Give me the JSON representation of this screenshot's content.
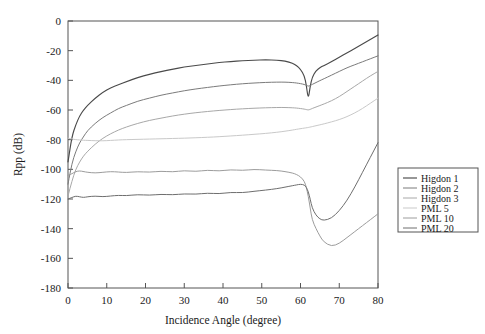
{
  "chart_data": {
    "type": "line",
    "title": "",
    "xlabel": "Incidence Angle (degree)",
    "ylabel": "Rpp (dB)",
    "xlim": [
      0,
      80
    ],
    "ylim": [
      -180,
      0
    ],
    "xticks": [
      0,
      10,
      20,
      30,
      40,
      50,
      60,
      70,
      80
    ],
    "yticks": [
      0,
      -20,
      -40,
      -60,
      -80,
      -100,
      -120,
      -140,
      -160,
      -180
    ],
    "xtick_labels": [
      "0",
      "10",
      "20",
      "30",
      "40",
      "50",
      "60",
      "70",
      "80"
    ],
    "ytick_labels": [
      "0",
      "-20",
      "-40",
      "-60",
      "-80",
      "-100",
      "-120",
      "-140",
      "-160",
      "-180"
    ],
    "grid": false,
    "legend_position": "right-outside",
    "brewster_angle": 62,
    "x": [
      0,
      1,
      2,
      3,
      4,
      5,
      7,
      9,
      11,
      13,
      15,
      18,
      21,
      24,
      27,
      30,
      33,
      36,
      39,
      42,
      45,
      48,
      51,
      54,
      56,
      58,
      59,
      60,
      61,
      61.5,
      62,
      62.5,
      63,
      64,
      65,
      66,
      68,
      70,
      72,
      74,
      76,
      78,
      80
    ],
    "series": [
      {
        "name": "Higdon 1",
        "color": "#4a4a4a",
        "width": 1.15,
        "values": [
          -95,
          -78,
          -70,
          -64,
          -60,
          -57,
          -52,
          -48,
          -45,
          -43,
          -41,
          -38,
          -36,
          -34,
          -32.5,
          -31,
          -30,
          -29,
          -28,
          -27.3,
          -26.8,
          -26.4,
          -26.2,
          -26.4,
          -27,
          -28.5,
          -30,
          -32.5,
          -37,
          -43,
          -53,
          -44,
          -38,
          -33.5,
          -31.5,
          -30,
          -27.5,
          -24.5,
          -21.5,
          -18.5,
          -15.5,
          -12.5,
          -9.5
        ]
      },
      {
        "name": "Higdon 2",
        "color": "#7b7b7b",
        "width": 1.0,
        "values": [
          -110,
          -96,
          -88,
          -82,
          -78,
          -74,
          -69,
          -65,
          -62,
          -59,
          -57,
          -54,
          -52,
          -50,
          -48.5,
          -47,
          -45.8,
          -44.8,
          -43.8,
          -43,
          -42.3,
          -41.8,
          -41.4,
          -41.2,
          -41.2,
          -41.5,
          -41.8,
          -42.2,
          -42.8,
          -43.3,
          -44,
          -43.5,
          -42.8,
          -41.5,
          -40.2,
          -39,
          -36.5,
          -34,
          -31.5,
          -29.5,
          -27.5,
          -25.5,
          -23.5
        ]
      },
      {
        "name": "Higdon 3",
        "color": "#a8a8a8",
        "width": 1.0,
        "values": [
          -118,
          -108,
          -100,
          -95,
          -91,
          -88,
          -83,
          -79,
          -76,
          -73.5,
          -71.5,
          -69,
          -67,
          -65.5,
          -64,
          -62.8,
          -61.8,
          -61,
          -60.3,
          -59.7,
          -59.2,
          -58.8,
          -58.5,
          -58.3,
          -58.3,
          -58.5,
          -58.7,
          -59,
          -59.4,
          -59.7,
          -60,
          -59.6,
          -59,
          -58,
          -57,
          -56,
          -53.8,
          -51,
          -47.5,
          -44,
          -40.5,
          -37,
          -34
        ]
      },
      {
        "name": "PML 5",
        "color": "#c9c9c9",
        "width": 1.0,
        "values": [
          -79,
          -79.5,
          -80,
          -80.2,
          -80.4,
          -80.5,
          -80.7,
          -80.8,
          -80.5,
          -80.2,
          -80,
          -79.8,
          -79.6,
          -79.4,
          -79.2,
          -79,
          -78.7,
          -78.4,
          -78,
          -77.5,
          -77,
          -76.4,
          -75.8,
          -75,
          -74.3,
          -73.5,
          -73,
          -72.6,
          -72.2,
          -72,
          -71.8,
          -71.5,
          -71.2,
          -70.6,
          -70,
          -69.4,
          -68,
          -66.5,
          -64.5,
          -62,
          -59,
          -55.5,
          -52
        ]
      },
      {
        "name": "PML 10",
        "color": "#9c9c9c",
        "width": 1.0,
        "values": [
          -104,
          -103,
          -101.5,
          -101,
          -101.5,
          -102,
          -102.5,
          -102,
          -101.5,
          -101.8,
          -102.2,
          -101.5,
          -102,
          -101.2,
          -101.8,
          -100.8,
          -101.5,
          -100.5,
          -101.2,
          -100.2,
          -100.8,
          -100,
          -100.5,
          -100.8,
          -101.5,
          -102.5,
          -103.5,
          -105,
          -108,
          -112,
          -118,
          -126,
          -134,
          -140,
          -145,
          -149,
          -152,
          -150,
          -146,
          -142,
          -138,
          -134,
          -130
        ]
      },
      {
        "name": "PML 20",
        "color": "#6e6e6e",
        "width": 1.0,
        "values": [
          -120,
          -119,
          -118,
          -118.5,
          -119,
          -118.5,
          -118,
          -118.5,
          -118,
          -117.5,
          -117.8,
          -117,
          -117.5,
          -116.8,
          -117.2,
          -116.5,
          -116.8,
          -116,
          -116.5,
          -115.5,
          -115.8,
          -114.8,
          -114,
          -113,
          -112,
          -111,
          -110.5,
          -110,
          -110.5,
          -112,
          -115,
          -120,
          -126,
          -131,
          -133.5,
          -134.5,
          -133,
          -128,
          -121,
          -112,
          -102,
          -92,
          -82
        ]
      }
    ]
  },
  "legend": {
    "entries": [
      {
        "label": "Higdon 1"
      },
      {
        "label": "Higdon 2"
      },
      {
        "label": "Higdon 3"
      },
      {
        "label": "PML 5"
      },
      {
        "label": "PML 10"
      },
      {
        "label": "PML 20"
      }
    ]
  }
}
